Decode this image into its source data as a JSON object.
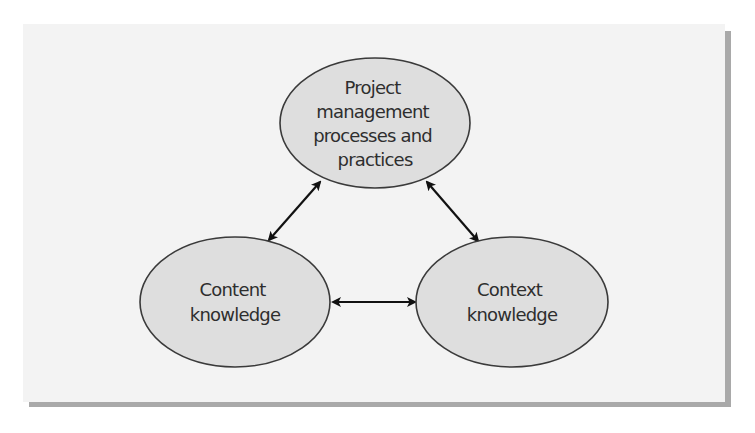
{
  "diagram": {
    "type": "triangle-of-relationships",
    "colors": {
      "panel_background": "#f3f3f3",
      "panel_shadow": "#a9a9a9",
      "node_fill": "#dedede",
      "node_stroke": "#3a3a3a",
      "arrow": "#111111",
      "text": "#2e2e2e"
    },
    "nodes": [
      {
        "id": "pm",
        "lines": [
          "Project",
          "management",
          "processes and",
          "practices"
        ]
      },
      {
        "id": "content",
        "lines": [
          "Content",
          "knowledge"
        ]
      },
      {
        "id": "context",
        "lines": [
          "Context",
          "knowledge"
        ]
      }
    ],
    "edges": [
      {
        "from": "pm",
        "to": "content",
        "direction": "bidirectional"
      },
      {
        "from": "pm",
        "to": "context",
        "direction": "bidirectional"
      },
      {
        "from": "content",
        "to": "context",
        "direction": "bidirectional"
      }
    ]
  }
}
